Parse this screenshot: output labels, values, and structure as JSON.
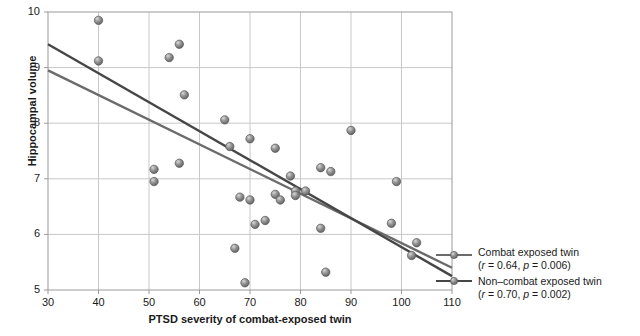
{
  "chart_data": {
    "type": "scatter",
    "title": "",
    "xlabel": "PTSD severity of combat-exposed twin",
    "ylabel": "Hippocampal volume",
    "xlim": [
      30,
      110
    ],
    "ylim": [
      5,
      10
    ],
    "xticks": [
      30,
      40,
      50,
      60,
      70,
      80,
      90,
      100,
      110
    ],
    "yticks": [
      5,
      6,
      7,
      8,
      9,
      10
    ],
    "grid": true,
    "legend_position": "right",
    "points": [
      {
        "x": 40,
        "y": 9.85
      },
      {
        "x": 40,
        "y": 9.12
      },
      {
        "x": 51,
        "y": 7.17
      },
      {
        "x": 51,
        "y": 6.95
      },
      {
        "x": 54,
        "y": 9.18
      },
      {
        "x": 56,
        "y": 9.42
      },
      {
        "x": 56,
        "y": 7.28
      },
      {
        "x": 57,
        "y": 8.51
      },
      {
        "x": 65,
        "y": 8.06
      },
      {
        "x": 66,
        "y": 7.58
      },
      {
        "x": 67,
        "y": 5.75
      },
      {
        "x": 68,
        "y": 6.67
      },
      {
        "x": 69,
        "y": 5.13
      },
      {
        "x": 70,
        "y": 7.72
      },
      {
        "x": 70,
        "y": 6.62
      },
      {
        "x": 71,
        "y": 6.18
      },
      {
        "x": 73,
        "y": 6.25
      },
      {
        "x": 75,
        "y": 7.55
      },
      {
        "x": 75,
        "y": 6.72
      },
      {
        "x": 76,
        "y": 6.62
      },
      {
        "x": 78,
        "y": 7.05
      },
      {
        "x": 79,
        "y": 6.78
      },
      {
        "x": 79,
        "y": 6.7
      },
      {
        "x": 81,
        "y": 6.78
      },
      {
        "x": 84,
        "y": 7.2
      },
      {
        "x": 84,
        "y": 6.11
      },
      {
        "x": 85,
        "y": 5.32
      },
      {
        "x": 86,
        "y": 7.13
      },
      {
        "x": 90,
        "y": 7.87
      },
      {
        "x": 98,
        "y": 6.2
      },
      {
        "x": 99,
        "y": 6.95
      },
      {
        "x": 102,
        "y": 5.62
      },
      {
        "x": 103,
        "y": 5.85
      }
    ],
    "trendlines": [
      {
        "name": "combat-exposed-twin-line",
        "label": "Combat exposed twin",
        "stat": "(r = 0.64, p = 0.006)",
        "r": 0.64,
        "p": 0.006,
        "color": "#6b6b6b",
        "x_start": 30,
        "y_start": 8.95,
        "x_end": 110,
        "y_end": 5.4
      },
      {
        "name": "non-combat-exposed-twin-line",
        "label": "Non–combat exposed twin",
        "stat": "(r = 0.70, p = 0.002)",
        "r": 0.7,
        "p": 0.002,
        "color": "#464646",
        "x_start": 30,
        "y_start": 9.42,
        "x_end": 110,
        "y_end": 5.25
      }
    ],
    "marker": {
      "shape": "sphere",
      "fill": "#8a8a8a",
      "edge": "#5a5a5a",
      "radius_px": 4.2
    },
    "colors": {
      "grid": "#c8c8c8",
      "frame": "#9a9a9a",
      "text": "#1a1a1a",
      "background": "#ffffff"
    }
  },
  "legend": {
    "entries": [
      {
        "label": "Combat exposed twin",
        "stat_prefix": "(",
        "r_symbol": "r",
        "r_value": " = 0.64, ",
        "p_symbol": "p",
        "p_value": " = 0.006)"
      },
      {
        "label": "Non–combat exposed twin",
        "stat_prefix": "(",
        "r_symbol": "r",
        "r_value": " = 0.70, ",
        "p_symbol": "p",
        "p_value": " = 0.002)"
      }
    ]
  },
  "axes": {
    "y_title": "Hippocampal volume",
    "x_title": "PTSD severity of combat-exposed twin",
    "y_tick_labels": [
      "10",
      "9",
      "8",
      "7",
      "6",
      "5"
    ],
    "x_tick_labels": [
      "30",
      "40",
      "50",
      "60",
      "70",
      "80",
      "90",
      "100",
      "110"
    ]
  }
}
